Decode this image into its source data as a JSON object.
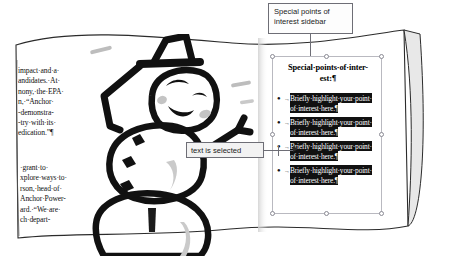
{
  "canvas": {
    "width": 452,
    "height": 263,
    "background": "#ffffff"
  },
  "colors": {
    "ink": "#111111",
    "highlight_background": "#111111",
    "highlight_text": "#ffffff",
    "callout_border": "#6e6e76",
    "selection_handle_border": "#8a8a94",
    "frame_border": "#b9b9c0",
    "page_edge": "#2b2b2b",
    "pencil_gray": "#b8b8b8"
  },
  "callouts": [
    {
      "name": "sidebar-callout",
      "line1": "Special points of",
      "line2": "interest sidebar",
      "points_to": "sidebar-text-box"
    },
    {
      "name": "selection-callout",
      "text": "text is selected",
      "points_to": "highlighted-bullet-text"
    }
  ],
  "document": {
    "left_column_top": [
      "impact·and·a·",
      "andidates.·At·",
      "nony,·the·EPA·",
      "n,·“Anchor·",
      "-demonstra-",
      "-try·with·its·",
      "edication.”¶"
    ],
    "left_column_bottom": [
      "·grant·to·",
      "xplore·ways·to·",
      "rson,·head·of·",
      "Anchor·Power-",
      "ard.·“We·are·",
      "ch·depart-"
    ],
    "artwork": "snowman-drawing"
  },
  "sidebar": {
    "name": "special-points-of-interest-sidebar",
    "selected": true,
    "title_line1": "Special·points·of·inter-",
    "title_line2": "est:¶",
    "bullet_marker": "●",
    "tab_marker": "→",
    "items": [
      {
        "line1": "Briefly·highlight·your·point·",
        "line2": "of·interest·here.¶",
        "highlighted": true
      },
      {
        "line1": "Briefly·highlight·your·point·",
        "line2": "of·interest·here.¶",
        "highlighted": true
      },
      {
        "line1": "Briefly·highlight·your·point·",
        "line2": "of·interest·here.¶",
        "highlighted": true
      },
      {
        "line1": "Briefly·highlight·your·point·",
        "line2": "of·interest·here.¶",
        "highlighted": true
      }
    ],
    "handles": [
      "top-left",
      "top-center",
      "top-right",
      "middle-left",
      "middle-right",
      "bottom-left",
      "bottom-center",
      "bottom-right"
    ]
  }
}
